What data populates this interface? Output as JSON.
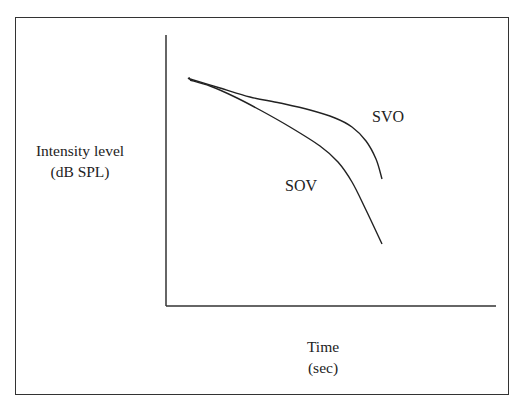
{
  "chart_data": {
    "type": "line",
    "title": "",
    "xlabel": "Time\n(sec)",
    "xlabel_lines": [
      "Time",
      "(sec)"
    ],
    "ylabel": "Intensity level\n(dB SPL)",
    "ylabel_lines": [
      "Intensity level",
      "(dB SPL)"
    ],
    "grid": false,
    "ticks": false,
    "legend": "none (direct curve labels)",
    "series": [
      {
        "name": "SVO",
        "label": "SVO",
        "description": "Upper curve: gradual decline then steeper drop at end",
        "points_px": [
          [
            190,
            79
          ],
          [
            220,
            88
          ],
          [
            250,
            97
          ],
          [
            280,
            103
          ],
          [
            310,
            110
          ],
          [
            335,
            118
          ],
          [
            352,
            127
          ],
          [
            366,
            141
          ],
          [
            376,
            159
          ],
          [
            382,
            179
          ]
        ]
      },
      {
        "name": "SOV",
        "label": "SOV",
        "description": "Lower curve: steeper decline throughout, ends lower",
        "points_px": [
          [
            190,
            80
          ],
          [
            210,
            86
          ],
          [
            235,
            97
          ],
          [
            260,
            110
          ],
          [
            290,
            127
          ],
          [
            320,
            146
          ],
          [
            338,
            162
          ],
          [
            352,
            182
          ],
          [
            366,
            210
          ],
          [
            382,
            244
          ]
        ]
      }
    ],
    "axes_px": {
      "origin": [
        166,
        306
      ],
      "y_top": [
        166,
        35
      ],
      "x_right": [
        496,
        306
      ]
    },
    "values_note": "Schematic/qualitative plot; no numeric tick values shown"
  },
  "labels": {
    "y_line1": "Intensity level",
    "y_line2": "(dB SPL)",
    "x_line1": "Time",
    "x_line2": "(sec)",
    "svo": "SVO",
    "sov": "SOV"
  },
  "colors": {
    "line": "#222222",
    "frame": "#333333",
    "background": "#ffffff"
  }
}
